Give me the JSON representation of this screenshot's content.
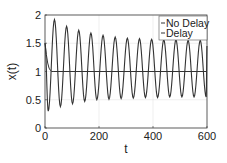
{
  "chart_data": {
    "type": "line",
    "title": "",
    "xlabel": "t",
    "ylabel": "x(t)",
    "xlim": [
      0,
      600
    ],
    "ylim": [
      0,
      2
    ],
    "xticks": [
      0,
      200,
      400,
      600
    ],
    "yticks": [
      0,
      0.5,
      1,
      1.5,
      2
    ],
    "ytick_labels": [
      "0",
      "0.5",
      "1",
      "1.5",
      "2"
    ],
    "xtick_labels": [
      "0",
      "200",
      "400",
      "600"
    ],
    "grid": true,
    "legend_position": "upper right",
    "series": [
      {
        "name": "No Delay",
        "color": "#333333",
        "description": "Starts at 1.5, decays monotonically to steady state 1.0 by t≈25, then constant",
        "x": [
          0,
          5,
          10,
          15,
          20,
          25,
          30,
          600
        ],
        "y": [
          1.5,
          1.3,
          1.15,
          1.06,
          1.02,
          1.0,
          1.0,
          1.0
        ]
      },
      {
        "name": "Delay",
        "color": "#333333",
        "description": "Damped oscillation approaching a sustained limit cycle, period ≈ 45",
        "period": 45,
        "initial_value": 1.5,
        "first_min": {
          "t": 12,
          "x": 0.3
        },
        "first_max": {
          "t": 35,
          "x": 1.92
        },
        "late_peak": 1.55,
        "late_trough": 0.55,
        "peaks": [
          {
            "t": 35,
            "x": 1.92
          },
          {
            "t": 80,
            "x": 1.8
          },
          {
            "t": 125,
            "x": 1.73
          },
          {
            "t": 170,
            "x": 1.68
          },
          {
            "t": 215,
            "x": 1.64
          },
          {
            "t": 260,
            "x": 1.61
          },
          {
            "t": 305,
            "x": 1.59
          },
          {
            "t": 350,
            "x": 1.58
          },
          {
            "t": 395,
            "x": 1.57
          },
          {
            "t": 440,
            "x": 1.56
          },
          {
            "t": 485,
            "x": 1.56
          },
          {
            "t": 530,
            "x": 1.55
          },
          {
            "t": 575,
            "x": 1.55
          }
        ],
        "troughs": [
          {
            "t": 12,
            "x": 0.3
          },
          {
            "t": 57,
            "x": 0.38
          },
          {
            "t": 102,
            "x": 0.43
          },
          {
            "t": 147,
            "x": 0.47
          },
          {
            "t": 192,
            "x": 0.5
          },
          {
            "t": 237,
            "x": 0.51
          },
          {
            "t": 282,
            "x": 0.52
          },
          {
            "t": 327,
            "x": 0.53
          },
          {
            "t": 372,
            "x": 0.54
          },
          {
            "t": 417,
            "x": 0.54
          },
          {
            "t": 462,
            "x": 0.55
          },
          {
            "t": 507,
            "x": 0.55
          },
          {
            "t": 552,
            "x": 0.55
          },
          {
            "t": 597,
            "x": 0.55
          }
        ]
      }
    ]
  },
  "legend": {
    "items": [
      {
        "label": "No Delay"
      },
      {
        "label": "Delay"
      }
    ]
  },
  "layout": {
    "plot": {
      "left": 45,
      "top": 15,
      "right": 207,
      "bottom": 128
    }
  }
}
